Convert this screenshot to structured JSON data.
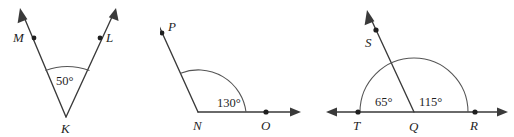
{
  "figure": {
    "type": "geometry-diagram-set",
    "background_color": "#ffffff",
    "line_color": "#3a3a3a",
    "arc_color": "#555555",
    "text_color": "#1f1f1f"
  },
  "diagrams": [
    {
      "id": "angle-mkl",
      "vertex_label": "K",
      "ray_labels": [
        "M",
        "L"
      ],
      "angle_labels": [
        "50°"
      ],
      "angle_values": [
        50
      ],
      "points": [
        "M",
        "L",
        "K"
      ]
    },
    {
      "id": "angle-pno",
      "vertex_label": "N",
      "ray_labels": [
        "P",
        "O"
      ],
      "angle_labels": [
        "130°"
      ],
      "angle_values": [
        130
      ],
      "points": [
        "P",
        "N",
        "O"
      ]
    },
    {
      "id": "angle-tqs-sqr",
      "vertex_label": "Q",
      "ray_labels": [
        "S",
        "T",
        "R"
      ],
      "angle_labels": [
        "65°",
        "115°"
      ],
      "angle_values": [
        65,
        115
      ],
      "points": [
        "S",
        "T",
        "Q",
        "R"
      ]
    }
  ],
  "labels": {
    "d1_M": "M",
    "d1_L": "L",
    "d1_K": "K",
    "d1_angle": "50°",
    "d2_P": "P",
    "d2_N": "N",
    "d2_O": "O",
    "d2_angle": "130°",
    "d3_S": "S",
    "d3_T": "T",
    "d3_Q": "Q",
    "d3_R": "R",
    "d3_angle_left": "65°",
    "d3_angle_right": "115°"
  }
}
